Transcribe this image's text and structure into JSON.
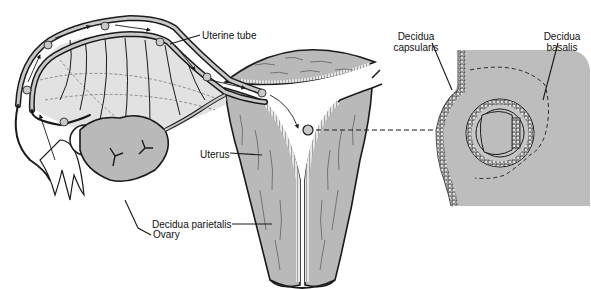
{
  "labels": {
    "uterine_tube": "Uterine tube",
    "uterus": "Uterus",
    "ovary": "Ovary",
    "decidua_parietalis": "Decidua parietalis",
    "decidua_capsularis_line1": "Decidua",
    "decidua_capsularis_line2": "capsularis",
    "decidua_basalis_line1": "Decidua",
    "decidua_basalis_line2": "basalis"
  },
  "colors": {
    "tissue_gray": "#b9b9b9",
    "light_gray": "#d8d8d8",
    "outline": "#1a1a1a",
    "background": "#ffffff"
  }
}
